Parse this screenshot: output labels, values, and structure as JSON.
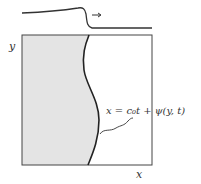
{
  "diagram": {
    "labels": {
      "y_axis": "y",
      "x_axis": "x",
      "equation": "x = c₀t + ψ(y, t)"
    },
    "colors": {
      "fill": "#e4e4e4",
      "stroke": "#333333"
    },
    "elements": [
      "wave-profile",
      "propagation-arrow",
      "domain-box",
      "shaded-region",
      "wavy-front",
      "leader-line"
    ]
  }
}
